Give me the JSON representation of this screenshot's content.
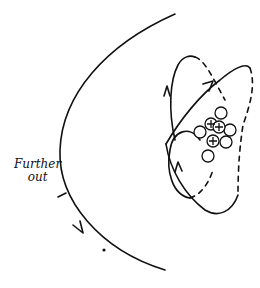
{
  "diagram": {
    "label": {
      "line1": "Further",
      "line2": "out"
    },
    "nucleus": {
      "protons": 3,
      "neutrons": 5,
      "proton_symbol": "+"
    },
    "orbits": [
      {
        "name": "inner-orbit-a",
        "style": "solid with dashed back half",
        "direction_arrow": "up"
      },
      {
        "name": "inner-orbit-b",
        "style": "solid with dashed back half",
        "direction_arrow": "up-right"
      },
      {
        "name": "outer-orbit",
        "style": "solid arc",
        "direction_arrow": "down"
      }
    ],
    "colors": {
      "ink": "#111111",
      "background": "#ffffff"
    }
  }
}
